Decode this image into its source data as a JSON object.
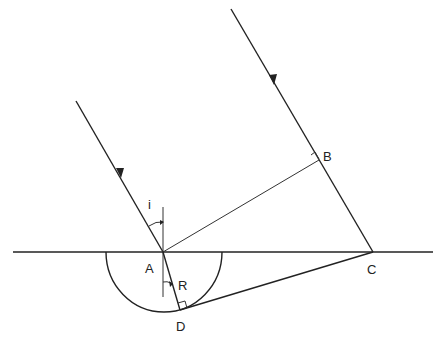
{
  "diagram": {
    "labels": {
      "A": "A",
      "B": "B",
      "C": "C",
      "D": "D",
      "i": "i",
      "R": "R"
    },
    "points": {
      "A": [
        163,
        252
      ],
      "B": [
        319,
        160
      ],
      "C": [
        373,
        252
      ],
      "D": [
        180,
        310
      ]
    },
    "colors": {
      "stroke": "#222222",
      "background": "#ffffff"
    }
  }
}
